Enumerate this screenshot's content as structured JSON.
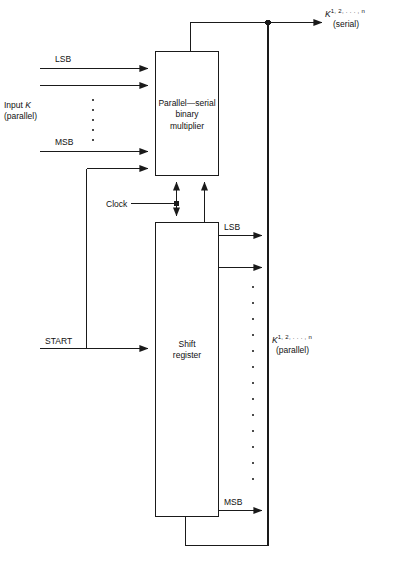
{
  "diagram": {
    "blocks": [
      {
        "id": "multiplier",
        "line1": "Parallel—serial",
        "line2": "binary",
        "line3": "multiplier"
      },
      {
        "id": "shift_register",
        "line1": "Shift",
        "line2": "register"
      }
    ],
    "labels": {
      "lsb_in": "LSB",
      "msb_in": "MSB",
      "input_k_line1_pre": "Input ",
      "input_k_symbol": "K",
      "input_k_line2": "(parallel)",
      "clock": "Clock",
      "start": "START",
      "lsb_out": "LSB",
      "msb_out": "MSB",
      "serial_symbol": "K",
      "serial_superscript": "1, 2, . . . , n",
      "serial_mode": "(serial)",
      "parallel_symbol": "K",
      "parallel_superscript": "1, 2, . . . , n",
      "parallel_mode": "(parallel)"
    },
    "ellipsis": {
      "input_dots": 5,
      "output_dots": 13
    },
    "colors": {
      "line": "#1a1a1a",
      "text": "#111111",
      "background": "#ffffff"
    }
  }
}
